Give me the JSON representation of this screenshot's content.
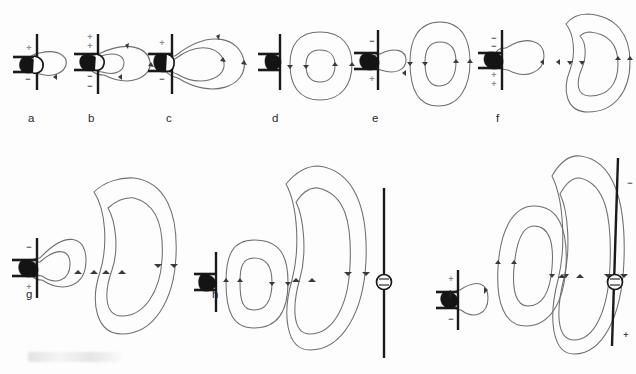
{
  "figure": {
    "kind": "electromagnetic-field-line-sequence",
    "background_color": "#fdfdfd",
    "fieldline_color": "#6e6e6e",
    "arrow_color": "#3a3a3a",
    "antenna_color": "#1a1a1a",
    "sign_color": "#8d8d8d"
  },
  "panels": [
    {
      "id": "a",
      "label": "a",
      "charge_top": "+",
      "charge_bottom": "−",
      "attached_loops": 1,
      "detached_loops": 0,
      "has_receiver": false,
      "receiver_signs": []
    },
    {
      "id": "b",
      "label": "b",
      "charge_top": "+",
      "charge_bottom": "−",
      "attached_loops": 2,
      "detached_loops": 0,
      "has_receiver": false,
      "receiver_signs": []
    },
    {
      "id": "c",
      "label": "c",
      "charge_top": "+",
      "charge_bottom": "−",
      "attached_loops": 2,
      "detached_loops": 0,
      "has_receiver": false,
      "receiver_signs": []
    },
    {
      "id": "d",
      "label": "d",
      "charge_top": "",
      "charge_bottom": "",
      "attached_loops": 0,
      "detached_loops": 2,
      "has_receiver": false,
      "receiver_signs": []
    },
    {
      "id": "e",
      "label": "e",
      "charge_top": "−",
      "charge_bottom": "+",
      "attached_loops": 1,
      "detached_loops": 2,
      "has_receiver": false,
      "receiver_signs": []
    },
    {
      "id": "f",
      "label": "f",
      "charge_top": "−",
      "charge_bottom": "+",
      "attached_loops": 1,
      "detached_loops": 2,
      "has_receiver": false,
      "receiver_signs": []
    },
    {
      "id": "g",
      "label": "g",
      "charge_top": "−",
      "charge_bottom": "+",
      "attached_loops": 2,
      "detached_loops": 2,
      "has_receiver": false,
      "receiver_signs": []
    },
    {
      "id": "h",
      "label": "h",
      "charge_top": "",
      "charge_bottom": "",
      "attached_loops": 0,
      "detached_loops": 4,
      "has_receiver": true,
      "receiver_signs": []
    },
    {
      "id": "i",
      "label": "i",
      "charge_top": "+",
      "charge_bottom": "−",
      "attached_loops": 1,
      "detached_loops": 4,
      "has_receiver": true,
      "receiver_signs": [
        "−",
        "+"
      ]
    }
  ],
  "symbols": {
    "plus": "+",
    "minus": "−"
  }
}
